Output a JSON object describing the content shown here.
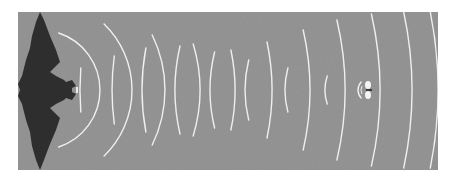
{
  "figure": {
    "colors": {
      "page_background": "#ffffff",
      "panel_background": "#8e8e8e",
      "bat": "#2e2e2e",
      "waves": "#efefef",
      "moth": "#f4f4f4"
    },
    "panel": {
      "x": 18,
      "y": 12,
      "width": 420,
      "height": 158
    },
    "bat": {
      "label": "bat-silhouette",
      "center_x": 45,
      "center_y": 90
    },
    "moth": {
      "label": "moth",
      "x": 370,
      "y": 90
    },
    "outgoing_waves": [
      {
        "cx": 40,
        "r": 60,
        "half_height": 70
      },
      {
        "cx": 40,
        "r": 92,
        "half_height": 66
      },
      {
        "cx": 40,
        "r": 125,
        "half_height": 55
      },
      {
        "cx": 40,
        "r": 160,
        "half_height": 46
      },
      {
        "cx": 40,
        "r": 195,
        "half_height": 40
      },
      {
        "cx": 40,
        "r": 232,
        "half_height": 48
      },
      {
        "cx": 40,
        "r": 270,
        "half_height": 60
      },
      {
        "cx": 40,
        "r": 305,
        "half_height": 70
      },
      {
        "cx": 40,
        "r": 340,
        "half_height": 76
      },
      {
        "cx": 40,
        "r": 372,
        "half_height": 78
      },
      {
        "cx": 40,
        "r": 398,
        "half_height": 78
      }
    ],
    "echo_waves": [
      {
        "cx": 370,
        "r": 12,
        "half_height": 8
      },
      {
        "cx": 370,
        "r": 45,
        "half_height": 14
      },
      {
        "cx": 370,
        "r": 85,
        "half_height": 22
      },
      {
        "cx": 370,
        "r": 125,
        "half_height": 30
      },
      {
        "cx": 370,
        "r": 160,
        "half_height": 38
      },
      {
        "cx": 370,
        "r": 195,
        "half_height": 44
      },
      {
        "cx": 370,
        "r": 228,
        "half_height": 42
      },
      {
        "cx": 370,
        "r": 258,
        "half_height": 34
      },
      {
        "cx": 370,
        "r": 290,
        "half_height": 22
      },
      {
        "cx": 370,
        "r": 320,
        "half_height": 12
      }
    ]
  }
}
